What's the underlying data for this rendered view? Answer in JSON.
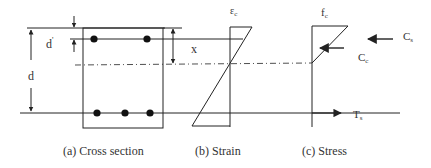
{
  "diagram": {
    "type": "reinforced-concrete-beam-section",
    "colors": {
      "line": "#222222",
      "background": "#ffffff",
      "text": "#333333"
    },
    "labels": {
      "d_prime": "d",
      "d_prime_mark": "'",
      "d": "d",
      "x": "x",
      "epsilon_c": "ε",
      "epsilon_c_sub": "c",
      "f_c": "f",
      "f_c_sub": "c",
      "C_s": "C",
      "C_s_sub": "s",
      "C_c": "C",
      "C_c_sub": "c",
      "T_s": "T",
      "T_s_sub": "s"
    },
    "captions": {
      "a": "(a) Cross section",
      "b": "(b) Strain",
      "c": "(c) Stress"
    },
    "cross_section": {
      "top_bars": 2,
      "bottom_bars": 3
    }
  }
}
